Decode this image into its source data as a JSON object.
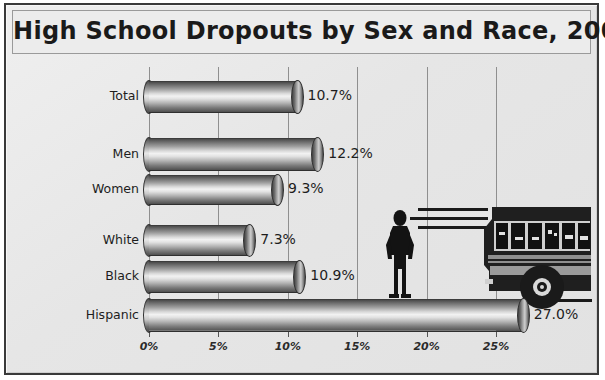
{
  "chart_data": {
    "type": "bar",
    "orientation": "horizontal",
    "title": "High School Dropouts by Sex and Race, 2001",
    "xlabel": "",
    "ylabel": "",
    "xlim": [
      0,
      27.6
    ],
    "grid": true,
    "legend": "none",
    "categories": [
      "Total",
      "Men",
      "Women",
      "White",
      "Black",
      "Hispanic"
    ],
    "values": [
      10.7,
      12.2,
      9.3,
      7.3,
      10.9,
      27.0
    ],
    "value_labels": [
      "10.7%",
      "12.2%",
      "9.3%",
      "7.3%",
      "10.9%",
      "27.0%"
    ],
    "x_ticks": [
      0,
      5,
      10,
      15,
      20,
      25
    ],
    "x_tick_labels": [
      "0%",
      "5%",
      "10%",
      "15%",
      "20%",
      "25%"
    ],
    "annotations": [
      "school-bus-illustration",
      "standing-person-silhouette",
      "motion-speed-lines"
    ]
  },
  "frame": {
    "border_color": "#3a3a3a",
    "background_color": "#e8e8e8"
  },
  "icons": {
    "bus": "school-bus-icon",
    "person": "person-silhouette-icon",
    "speed_lines": "motion-lines-icon"
  }
}
